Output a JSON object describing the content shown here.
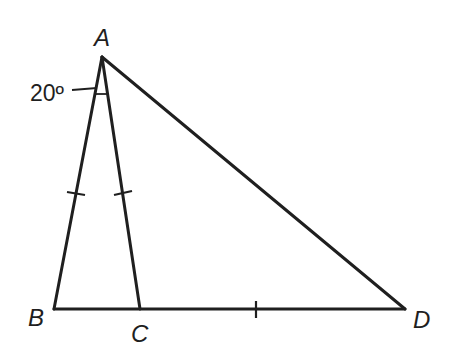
{
  "figure": {
    "type": "geometry-triangle",
    "points": {
      "A": {
        "label": "A",
        "x": 102,
        "y": 57
      },
      "B": {
        "label": "B",
        "x": 54,
        "y": 309
      },
      "C": {
        "label": "C",
        "x": 140,
        "y": 309
      },
      "D": {
        "label": "D",
        "x": 405,
        "y": 309
      }
    },
    "segments": [
      "AB",
      "AC",
      "AD",
      "BD"
    ],
    "congruent_marks": [
      "AB",
      "AC",
      "CD"
    ],
    "angle": {
      "vertex": "A",
      "between": [
        "AB",
        "AC"
      ],
      "label": "20º"
    },
    "colors": {
      "stroke": "#1f1f1f",
      "background": "#ffffff"
    }
  }
}
